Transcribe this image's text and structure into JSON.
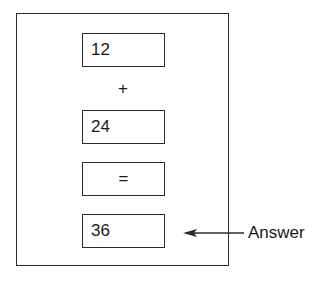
{
  "diagram": {
    "operand_1": "12",
    "operator_plus": "+",
    "operand_2": "24",
    "operator_equals": "=",
    "result": "36",
    "annotation": "Answer",
    "arrow_direction": "left",
    "colors": {
      "stroke": "#2a2a2a",
      "background": "#ffffff",
      "text": "#1a1a1a"
    }
  }
}
